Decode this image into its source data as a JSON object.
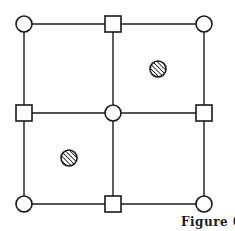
{
  "figure": {
    "caption": "Figure 6",
    "colors": {
      "stroke": "#1a1a1a",
      "background": "#ffffff"
    },
    "grid": {
      "xs": [
        24,
        113,
        204
      ],
      "ys": [
        24,
        113,
        204
      ]
    },
    "nodes": [
      {
        "shape": "circle",
        "row": 0,
        "col": 0
      },
      {
        "shape": "square",
        "row": 0,
        "col": 1
      },
      {
        "shape": "circle",
        "row": 0,
        "col": 2
      },
      {
        "shape": "square",
        "row": 1,
        "col": 0
      },
      {
        "shape": "circle",
        "row": 1,
        "col": 1
      },
      {
        "shape": "square",
        "row": 1,
        "col": 2
      },
      {
        "shape": "circle",
        "row": 2,
        "col": 0
      },
      {
        "shape": "square",
        "row": 2,
        "col": 1
      },
      {
        "shape": "circle",
        "row": 2,
        "col": 2
      }
    ],
    "hatched_markers": [
      {
        "cell": "top-right",
        "x": 158,
        "y": 69
      },
      {
        "cell": "bottom-left",
        "x": 69,
        "y": 158
      }
    ]
  }
}
